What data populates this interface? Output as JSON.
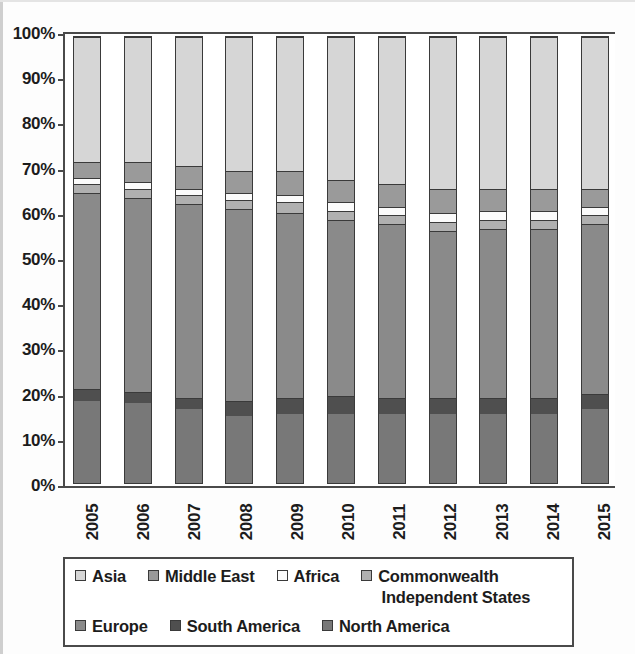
{
  "chart_data": {
    "type": "bar",
    "variant": "stacked-100-percent",
    "title": "",
    "xlabel": "",
    "ylabel": "",
    "ylim": [
      0,
      100
    ],
    "ytick_labels": [
      "100%",
      "90%",
      "80%",
      "70%",
      "60%",
      "50%",
      "40%",
      "30%",
      "20%",
      "10%",
      "0%"
    ],
    "ytick_values": [
      100,
      90,
      80,
      70,
      60,
      50,
      40,
      30,
      20,
      10,
      0
    ],
    "grid": false,
    "legend_position": "bottom",
    "categories": [
      "2005",
      "2006",
      "2007",
      "2008",
      "2009",
      "2010",
      "2011",
      "2012",
      "2013",
      "2014",
      "2015"
    ],
    "stack_order_bottom_to_top": [
      "North America",
      "South America",
      "Europe",
      "Commonwealth Independent States",
      "Africa",
      "Middle East",
      "Asia"
    ],
    "series": [
      {
        "name": "North America",
        "color": "#787878",
        "values": [
          18.5,
          18.0,
          16.5,
          15.0,
          15.5,
          15.5,
          15.5,
          15.5,
          15.5,
          15.5,
          16.5
        ]
      },
      {
        "name": "South America",
        "color": "#4f4f4f",
        "values": [
          2.5,
          2.5,
          2.5,
          3.5,
          3.5,
          4.0,
          3.5,
          3.5,
          3.5,
          3.5,
          3.5
        ]
      },
      {
        "name": "Europe",
        "color": "#8a8a8a",
        "values": [
          44.0,
          43.5,
          43.5,
          43.0,
          41.5,
          39.5,
          39.0,
          37.5,
          38.0,
          38.0,
          38.0
        ]
      },
      {
        "name": "Commonwealth Independent States",
        "color": "#b0b0b0",
        "values": [
          2.0,
          2.0,
          2.0,
          2.0,
          2.5,
          2.0,
          2.0,
          2.0,
          2.0,
          2.0,
          2.0
        ]
      },
      {
        "name": "Africa",
        "color": "#fbfbfb",
        "values": [
          1.5,
          1.5,
          1.5,
          1.5,
          1.5,
          2.0,
          2.0,
          2.0,
          2.0,
          2.0,
          2.0
        ]
      },
      {
        "name": "Middle East",
        "color": "#9a9a9a",
        "values": [
          3.5,
          4.5,
          5.0,
          5.0,
          5.5,
          5.0,
          5.0,
          5.5,
          5.0,
          5.0,
          4.0
        ]
      },
      {
        "name": "Asia",
        "color": "#d6d6d6",
        "values": [
          28.0,
          28.0,
          29.0,
          30.0,
          30.0,
          32.0,
          33.0,
          34.0,
          34.0,
          34.0,
          34.0
        ]
      }
    ]
  },
  "legend": {
    "row1": [
      {
        "label": "Asia",
        "color": "#d6d6d6"
      },
      {
        "label": "Middle East",
        "color": "#9a9a9a"
      },
      {
        "label": "Africa",
        "color": "#fbfbfb"
      }
    ],
    "cis": {
      "line1": "Commonwealth",
      "line2": "Independent States",
      "color": "#b0b0b0"
    },
    "row2": [
      {
        "label": "Europe",
        "color": "#8a8a8a"
      },
      {
        "label": "South America",
        "color": "#4f4f4f"
      },
      {
        "label": "North America",
        "color": "#787878"
      }
    ]
  }
}
